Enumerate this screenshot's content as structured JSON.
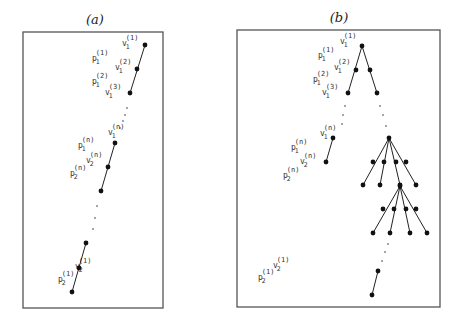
{
  "panels": [
    {
      "title": "(a)",
      "labels": [
        {
          "base": "v",
          "sub": "1",
          "sup": "(1)"
        },
        {
          "base": "p",
          "sub": "1",
          "sup": "(1)"
        },
        {
          "base": "v",
          "sub": "1",
          "sup": "(2)"
        },
        {
          "base": "p",
          "sub": "1",
          "sup": "(2)"
        },
        {
          "base": "v",
          "sub": "1",
          "sup": "(3)"
        },
        {
          "base": "v",
          "sub": "1",
          "sup": "(n)"
        },
        {
          "base": "p",
          "sub": "1",
          "sup": "(n)"
        },
        {
          "base": "v",
          "sub": "2",
          "sup": "(n)"
        },
        {
          "base": "p",
          "sub": "2",
          "sup": "(n)"
        },
        {
          "base": "v",
          "sub": "2",
          "sup": "(1)"
        },
        {
          "base": "p",
          "sub": "2",
          "sup": "(1)"
        }
      ]
    },
    {
      "title": "(b)",
      "labels": [
        {
          "base": "v",
          "sub": "1",
          "sup": "(1)"
        },
        {
          "base": "p",
          "sub": "1",
          "sup": "(1)"
        },
        {
          "base": "v",
          "sub": "1",
          "sup": "(2)"
        },
        {
          "base": "p",
          "sub": "1",
          "sup": "(2)"
        },
        {
          "base": "v",
          "sub": "1",
          "sup": "(3)"
        },
        {
          "base": "v",
          "sub": "1",
          "sup": "(n)"
        },
        {
          "base": "p",
          "sub": "1",
          "sup": "(n)"
        },
        {
          "base": "v",
          "sub": "2",
          "sup": "(n)"
        },
        {
          "base": "p",
          "sub": "2",
          "sup": "(n)"
        },
        {
          "base": "v",
          "sub": "2",
          "sup": "(1)"
        },
        {
          "base": "p",
          "sub": "2",
          "sup": "(1)"
        }
      ]
    }
  ]
}
